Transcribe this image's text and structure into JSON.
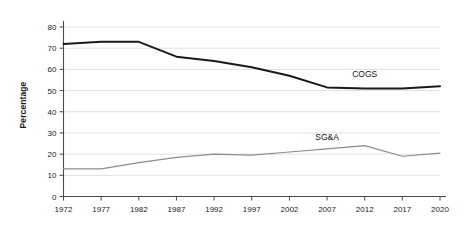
{
  "chart_data": {
    "type": "line",
    "title": "",
    "xlabel": "",
    "ylabel": "Percentage",
    "categories": [
      "1972",
      "1977",
      "1982",
      "1987",
      "1992",
      "1997",
      "2002",
      "2007",
      "2012",
      "2017",
      "2020"
    ],
    "ylim": [
      0,
      80
    ],
    "yticks": [
      0,
      10,
      20,
      30,
      40,
      50,
      60,
      70,
      80
    ],
    "ytick_labels": [
      "0",
      "10",
      "20",
      "30",
      "40",
      "50",
      "60",
      "70",
      "80"
    ],
    "grid": true,
    "grid_axis": "y",
    "legend": "inline-labels",
    "series": [
      {
        "name": "COGS",
        "color": "#1a1a1a",
        "width": 2.0,
        "values": [
          72,
          73,
          73,
          66,
          64,
          61,
          57,
          51.5,
          51,
          51,
          52
        ],
        "label_x": "2012",
        "label_value": 58
      },
      {
        "name": "SG&A",
        "color": "#8c8c8c",
        "width": 1.2,
        "values": [
          13,
          13,
          16,
          18.5,
          20,
          19.5,
          21,
          22.5,
          24,
          19,
          20.5
        ],
        "label_x": "2007",
        "label_value": 28
      }
    ]
  },
  "annotations": [
    {
      "text": "COGS"
    },
    {
      "text": "SG&A"
    }
  ]
}
